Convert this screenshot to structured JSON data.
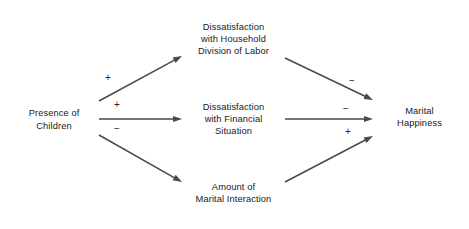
{
  "diagram": {
    "nodes": [
      {
        "id": "presence-of-children",
        "label": "Presence of\nChildren",
        "x": 13,
        "y": 97,
        "w": 82,
        "h": 45
      },
      {
        "id": "dissatisfaction-household-division-of-labor",
        "label": "Dissatisfaction\nwith Household\nDivision of Labor",
        "x": 186,
        "y": 11,
        "w": 95,
        "h": 56
      },
      {
        "id": "dissatisfaction-financial-situation",
        "label": "Dissatisfaction\nwith Financial\nSituation",
        "x": 186,
        "y": 95,
        "w": 95,
        "h": 48
      },
      {
        "id": "amount-of-marital-interaction",
        "label": "Amount of\nMarital Interaction",
        "x": 186,
        "y": 170,
        "w": 95,
        "h": 46
      },
      {
        "id": "marital-happiness",
        "label": "Marital\nHappiness",
        "x": 377,
        "y": 92,
        "w": 85,
        "h": 50
      }
    ],
    "edges": [
      {
        "id": "children-to-household-labor",
        "from": "presence-of-children",
        "to": "dissatisfaction-household-division-of-labor",
        "sign": "+",
        "x1": 99,
        "y1": 101,
        "x2": 182,
        "y2": 56,
        "sign_x": 108,
        "sign_y": 73
      },
      {
        "id": "children-to-financial",
        "from": "presence-of-children",
        "to": "dissatisfaction-financial-situation",
        "sign": "+",
        "x1": 99,
        "y1": 119,
        "x2": 182,
        "y2": 119,
        "sign_x": 117,
        "sign_y": 100
      },
      {
        "id": "children-to-marital-interaction",
        "from": "presence-of-children",
        "to": "amount-of-marital-interaction",
        "sign": "−",
        "x1": 99,
        "y1": 135,
        "x2": 182,
        "y2": 182,
        "sign_x": 117,
        "sign_y": 124
      },
      {
        "id": "household-labor-to-happiness",
        "from": "dissatisfaction-household-division-of-labor",
        "to": "marital-happiness",
        "sign": "−",
        "x1": 285,
        "y1": 58,
        "x2": 373,
        "y2": 100,
        "sign_x": 352,
        "sign_y": 76
      },
      {
        "id": "financial-to-happiness",
        "from": "dissatisfaction-financial-situation",
        "to": "marital-happiness",
        "sign": "−",
        "x1": 285,
        "y1": 119,
        "x2": 373,
        "y2": 119,
        "sign_x": 346,
        "sign_y": 104
      },
      {
        "id": "marital-interaction-to-happiness",
        "from": "amount-of-marital-interaction",
        "to": "marital-happiness",
        "sign": "+",
        "x1": 285,
        "y1": 182,
        "x2": 373,
        "y2": 136,
        "sign_x": 348,
        "sign_y": 127
      }
    ],
    "colors": {
      "box_border": "#3a3a3a",
      "arrow": "#4a4a4a",
      "text": "#1a1a1a",
      "background": "#ffffff"
    }
  }
}
